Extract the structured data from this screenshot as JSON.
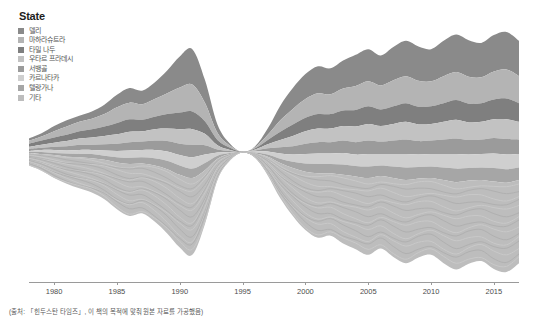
{
  "legend": {
    "title": "State",
    "items": [
      {
        "label": "델리",
        "color": "#8a8a8a"
      },
      {
        "label": "마하라슈트라",
        "color": "#b4b4b4"
      },
      {
        "label": "타밀 나두",
        "color": "#7f7f7f"
      },
      {
        "label": "우타르 프라데시",
        "color": "#c2c2c2"
      },
      {
        "label": "서뱅골",
        "color": "#9b9b9b"
      },
      {
        "label": "카르나타카",
        "color": "#cfcfcf"
      },
      {
        "label": "텔랑가나",
        "color": "#a6a6a6"
      },
      {
        "label": "기타",
        "color": "#bdbdbd"
      }
    ]
  },
  "footnote": "(출처: 「힌두스탄 타임즈」, 이 책의 목적에 맞춰 원본 자료를 가공했음)",
  "chart_data": {
    "type": "area",
    "variant": "streamgraph",
    "title": "",
    "subtitle": "",
    "xlabel": "",
    "ylabel": "",
    "xlim": [
      1978,
      2017
    ],
    "xticks": [
      1980,
      1985,
      1990,
      1995,
      2000,
      2005,
      2010,
      2015
    ],
    "xtick_labels": [
      "1980",
      "1985",
      "1990",
      "1995",
      "2000",
      "2005",
      "2010",
      "2015"
    ],
    "grid": false,
    "legend_position": "top-left",
    "legend_title": "State",
    "baseline": "wiggle",
    "x": [
      1978,
      1979,
      1980,
      1981,
      1982,
      1983,
      1984,
      1985,
      1986,
      1987,
      1988,
      1989,
      1990,
      1991,
      1992,
      1993,
      1994,
      1995,
      1996,
      1997,
      1998,
      1999,
      2000,
      2001,
      2002,
      2003,
      2004,
      2005,
      2006,
      2007,
      2008,
      2009,
      2010,
      2011,
      2012,
      2013,
      2014,
      2015,
      2016,
      2017
    ],
    "series": [
      {
        "name": "델리",
        "color": "#8a8a8a",
        "values": [
          2,
          3,
          5,
          6,
          6,
          7,
          9,
          12,
          14,
          13,
          16,
          22,
          30,
          34,
          22,
          8,
          2,
          0,
          1,
          6,
          14,
          20,
          24,
          26,
          25,
          27,
          30,
          31,
          29,
          32,
          34,
          33,
          31,
          34,
          36,
          35,
          33,
          35,
          36,
          34
        ]
      },
      {
        "name": "마하라슈트라",
        "color": "#b4b4b4",
        "values": [
          3,
          4,
          6,
          8,
          9,
          10,
          12,
          15,
          16,
          15,
          17,
          20,
          24,
          26,
          18,
          7,
          2,
          0,
          1,
          5,
          11,
          15,
          18,
          20,
          19,
          21,
          23,
          24,
          23,
          25,
          26,
          25,
          24,
          26,
          27,
          26,
          25,
          27,
          28,
          26
        ]
      },
      {
        "name": "타밀 나두",
        "color": "#7f7f7f",
        "values": [
          3,
          4,
          5,
          6,
          7,
          8,
          9,
          11,
          12,
          11,
          12,
          14,
          16,
          17,
          12,
          5,
          2,
          0,
          1,
          4,
          8,
          11,
          13,
          14,
          14,
          15,
          16,
          17,
          16,
          17,
          18,
          17,
          17,
          18,
          19,
          18,
          18,
          19,
          20,
          18
        ]
      },
      {
        "name": "우타르 프라데시",
        "color": "#c2c2c2",
        "values": [
          2,
          3,
          4,
          5,
          6,
          7,
          8,
          9,
          10,
          10,
          11,
          12,
          14,
          15,
          11,
          4,
          1,
          0,
          1,
          4,
          7,
          10,
          12,
          13,
          13,
          14,
          15,
          16,
          15,
          16,
          17,
          16,
          16,
          17,
          18,
          17,
          17,
          18,
          19,
          17
        ]
      },
      {
        "name": "서뱅골",
        "color": "#9b9b9b",
        "values": [
          2,
          2,
          3,
          4,
          5,
          5,
          6,
          7,
          8,
          8,
          9,
          10,
          11,
          12,
          9,
          3,
          1,
          0,
          1,
          3,
          6,
          8,
          10,
          11,
          11,
          12,
          12,
          13,
          12,
          13,
          14,
          13,
          13,
          14,
          15,
          14,
          14,
          15,
          15,
          14
        ]
      },
      {
        "name": "카르나타카",
        "color": "#cfcfcf",
        "values": [
          1,
          2,
          3,
          3,
          4,
          4,
          5,
          6,
          7,
          7,
          8,
          9,
          10,
          11,
          8,
          3,
          1,
          0,
          1,
          3,
          5,
          7,
          9,
          10,
          10,
          11,
          11,
          12,
          11,
          12,
          13,
          12,
          12,
          13,
          14,
          13,
          13,
          14,
          14,
          13
        ]
      },
      {
        "name": "텔랑가나",
        "color": "#a6a6a6",
        "values": [
          1,
          2,
          2,
          3,
          3,
          4,
          4,
          5,
          6,
          6,
          7,
          8,
          9,
          9,
          7,
          3,
          1,
          0,
          1,
          2,
          4,
          6,
          8,
          9,
          9,
          10,
          10,
          11,
          10,
          11,
          12,
          11,
          11,
          12,
          13,
          12,
          12,
          13,
          13,
          12
        ]
      },
      {
        "name": "기타",
        "color": "#bdbdbd",
        "values": [
          12,
          16,
          22,
          26,
          30,
          33,
          38,
          45,
          50,
          48,
          54,
          62,
          70,
          74,
          52,
          20,
          6,
          0,
          4,
          18,
          34,
          46,
          56,
          62,
          60,
          66,
          70,
          74,
          70,
          76,
          80,
          76,
          74,
          80,
          84,
          80,
          78,
          84,
          86,
          80
        ]
      }
    ]
  }
}
